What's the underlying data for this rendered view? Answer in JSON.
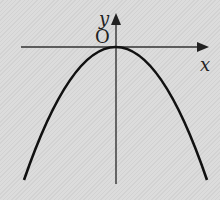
{
  "figure": {
    "type": "parabola-graph",
    "labels": {
      "y_axis": "y",
      "x_axis": "x",
      "origin": "O"
    },
    "colors": {
      "background": "#d9d9d9",
      "curve": "#111111",
      "axes": "#333333"
    }
  }
}
